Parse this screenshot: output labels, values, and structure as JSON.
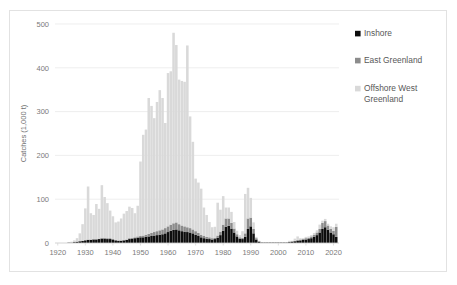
{
  "chart_data": {
    "type": "bar",
    "stacked": true,
    "title": "",
    "subtitle": "",
    "xlabel": "",
    "ylabel": "Catches (1,000 t)",
    "xlim": [
      1919,
      2022
    ],
    "ylim": [
      0,
      500
    ],
    "ytick_labels": [
      "0",
      "100",
      "200",
      "300",
      "400",
      "500"
    ],
    "ytick_values": [
      0,
      100,
      200,
      300,
      400,
      500
    ],
    "xtick_labels": [
      "1920",
      "1930",
      "1940",
      "1950",
      "1960",
      "1970",
      "1980",
      "1990",
      "2000",
      "2010",
      "2020"
    ],
    "xtick_values": [
      1920,
      1930,
      1940,
      1950,
      1960,
      1970,
      1980,
      1990,
      2000,
      2010,
      2020
    ],
    "grid": "horizontal",
    "legend_position": "top-right",
    "colors": {
      "inshore": "#0d0d0d",
      "east_greenland": "#8c8c8c",
      "offshore_west_greenland": "#d9d9d9",
      "gridline": "#e6e6e6",
      "axis_text": "#7a7a7a",
      "frame": "#e2e2e2",
      "background": "#ffffff"
    },
    "x": [
      1924,
      1925,
      1926,
      1927,
      1928,
      1929,
      1930,
      1931,
      1932,
      1933,
      1934,
      1935,
      1936,
      1937,
      1938,
      1939,
      1940,
      1941,
      1942,
      1943,
      1944,
      1945,
      1946,
      1947,
      1948,
      1949,
      1950,
      1951,
      1952,
      1953,
      1954,
      1955,
      1956,
      1957,
      1958,
      1959,
      1960,
      1961,
      1962,
      1963,
      1964,
      1965,
      1966,
      1967,
      1968,
      1969,
      1970,
      1971,
      1972,
      1973,
      1974,
      1975,
      1976,
      1977,
      1978,
      1979,
      1980,
      1981,
      1982,
      1983,
      1984,
      1985,
      1986,
      1987,
      1988,
      1989,
      1990,
      1991,
      1992,
      1993,
      1994,
      1995,
      1996,
      1997,
      1998,
      1999,
      2000,
      2001,
      2002,
      2003,
      2004,
      2005,
      2006,
      2007,
      2008,
      2009,
      2010,
      2011,
      2012,
      2013,
      2014,
      2015,
      2016,
      2017,
      2018,
      2019,
      2020,
      2021
    ],
    "series": [
      {
        "name": "Inshore",
        "color": "#0d0d0d",
        "values": [
          1,
          1,
          2,
          3,
          4,
          5,
          6,
          7,
          7,
          8,
          8,
          9,
          10,
          10,
          9,
          9,
          8,
          6,
          5,
          5,
          6,
          7,
          9,
          10,
          11,
          12,
          13,
          13,
          14,
          15,
          16,
          17,
          18,
          19,
          20,
          22,
          25,
          28,
          30,
          31,
          29,
          27,
          26,
          25,
          24,
          22,
          19,
          16,
          13,
          11,
          10,
          9,
          8,
          9,
          12,
          18,
          28,
          37,
          39,
          33,
          24,
          15,
          10,
          9,
          14,
          32,
          38,
          22,
          8,
          3,
          1,
          1,
          1,
          1,
          1,
          1,
          1,
          1,
          1,
          1,
          2,
          3,
          4,
          5,
          6,
          7,
          8,
          9,
          11,
          14,
          18,
          24,
          32,
          36,
          30,
          24,
          20,
          14
        ]
      },
      {
        "name": "East Greenland",
        "color": "#8c8c8c",
        "values": [
          0,
          0,
          0,
          0,
          0,
          0,
          1,
          1,
          1,
          1,
          1,
          1,
          2,
          2,
          2,
          2,
          1,
          1,
          1,
          1,
          1,
          1,
          2,
          2,
          2,
          3,
          3,
          4,
          5,
          6,
          7,
          8,
          9,
          10,
          11,
          12,
          13,
          14,
          15,
          16,
          14,
          13,
          12,
          11,
          10,
          9,
          8,
          7,
          6,
          5,
          4,
          4,
          3,
          3,
          5,
          8,
          14,
          19,
          17,
          13,
          9,
          5,
          3,
          3,
          8,
          24,
          20,
          10,
          3,
          1,
          0,
          0,
          0,
          0,
          0,
          0,
          0,
          0,
          0,
          0,
          1,
          1,
          1,
          2,
          2,
          2,
          3,
          3,
          4,
          5,
          6,
          8,
          14,
          14,
          10,
          8,
          8,
          23
        ]
      },
      {
        "name": "Offshore West Greenland",
        "color": "#d9d9d9",
        "values": [
          1,
          2,
          4,
          8,
          18,
          38,
          72,
          121,
          60,
          55,
          80,
          68,
          120,
          93,
          80,
          63,
          52,
          40,
          43,
          50,
          60,
          65,
          72,
          68,
          55,
          70,
          170,
          230,
          240,
          310,
          290,
          260,
          295,
          320,
          300,
          240,
          350,
          350,
          435,
          405,
          330,
          330,
          330,
          415,
          255,
          200,
          120,
          115,
          105,
          65,
          50,
          35,
          25,
          25,
          75,
          50,
          65,
          25,
          25,
          25,
          15,
          8,
          5,
          15,
          90,
          70,
          45,
          15,
          3,
          1,
          0,
          0,
          0,
          0,
          0,
          0,
          0,
          0,
          0,
          0,
          2,
          1,
          5,
          8,
          3,
          2,
          3,
          3,
          3,
          4,
          5,
          10,
          5,
          5,
          4,
          6,
          8,
          7
        ]
      }
    ]
  },
  "legend": {
    "items": [
      {
        "label": "Inshore",
        "color": "#0d0d0d"
      },
      {
        "label": "East Greenland",
        "color": "#8c8c8c"
      },
      {
        "label": "Offshore West Greenland",
        "color": "#d9d9d9"
      }
    ]
  }
}
